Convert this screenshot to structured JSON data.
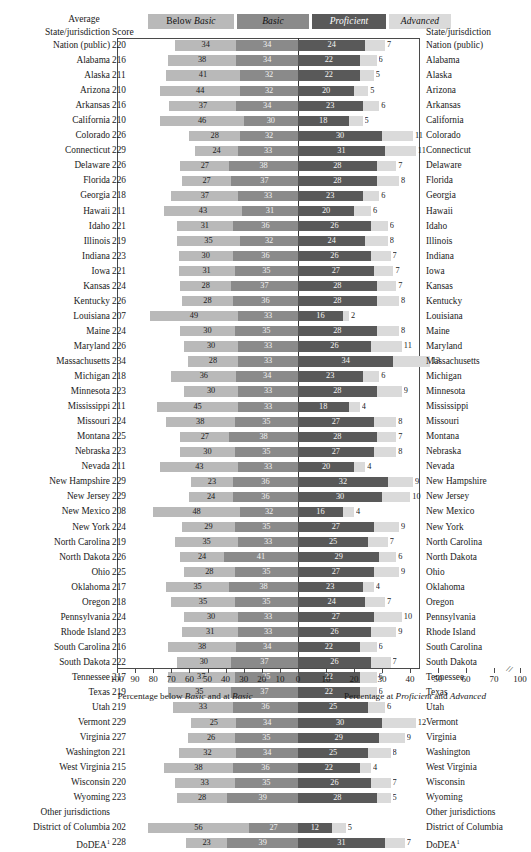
{
  "headers": {
    "average": "Average",
    "score": "Score",
    "state_left": "State/jurisdiction",
    "state_right": "State/jurisdiction"
  },
  "legend": [
    {
      "key": "below_basic",
      "prefix": "Below ",
      "label": "Basic",
      "color": "#b9b9b9"
    },
    {
      "key": "basic",
      "prefix": "",
      "label": "Basic",
      "color": "#8a8a8a"
    },
    {
      "key": "proficient",
      "prefix": "",
      "label": "Proficient",
      "color": "#595959"
    },
    {
      "key": "advanced",
      "prefix": "",
      "label": "Advanced",
      "color": "#dadada"
    }
  ],
  "axis": {
    "left_caption_pre": "Percentage below ",
    "left_caption_it1": "Basic",
    "left_caption_mid": " and at ",
    "left_caption_it2": "Basic",
    "right_caption_pre": "Percentage at ",
    "right_caption_it1": "Proficient",
    "right_caption_mid": " and ",
    "right_caption_it2": "Advanced",
    "ticks_left": [
      100,
      90,
      80,
      70,
      60,
      50,
      40,
      30,
      20,
      10,
      0
    ],
    "ticks_right": [
      10,
      20,
      30,
      40,
      50,
      60,
      70,
      100
    ],
    "break_glyph": "//"
  },
  "group_label": "Other jurisdictions",
  "dodea_footnote": "1",
  "chart_data": {
    "type": "bar",
    "title": "",
    "xlabel": "Percentage below Basic and at Basic | Percentage at Proficient and Advanced",
    "ylabel": "State/jurisdiction",
    "series": [
      {
        "name": "Below Basic",
        "color": "#b9b9b9"
      },
      {
        "name": "Basic",
        "color": "#8a8a8a"
      },
      {
        "name": "Proficient",
        "color": "#595959"
      },
      {
        "name": "Advanced",
        "color": "#dadada"
      }
    ],
    "xlim_left": [
      0,
      100
    ],
    "xlim_right": [
      0,
      100
    ],
    "grid": false,
    "legend_position": "top",
    "columns": [
      "State/jurisdiction",
      "Average Score",
      "Below Basic",
      "Basic",
      "Proficient",
      "Advanced"
    ],
    "rows": [
      {
        "state": "Nation (public)",
        "score": 220,
        "below_basic": 34,
        "basic": 34,
        "proficient": 24,
        "advanced": 7
      },
      {
        "state": "Alabama",
        "score": 216,
        "below_basic": 38,
        "basic": 34,
        "proficient": 22,
        "advanced": 6
      },
      {
        "state": "Alaska",
        "score": 211,
        "below_basic": 41,
        "basic": 32,
        "proficient": 22,
        "advanced": 5
      },
      {
        "state": "Arizona",
        "score": 210,
        "below_basic": 44,
        "basic": 32,
        "proficient": 20,
        "advanced": 5
      },
      {
        "state": "Arkansas",
        "score": 216,
        "below_basic": 37,
        "basic": 34,
        "proficient": 23,
        "advanced": 6
      },
      {
        "state": "California",
        "score": 210,
        "below_basic": 46,
        "basic": 30,
        "proficient": 18,
        "advanced": 5
      },
      {
        "state": "Colorado",
        "score": 226,
        "below_basic": 28,
        "basic": 32,
        "proficient": 30,
        "advanced": 11
      },
      {
        "state": "Connecticut",
        "score": 229,
        "below_basic": 24,
        "basic": 33,
        "proficient": 31,
        "advanced": 11
      },
      {
        "state": "Delaware",
        "score": 226,
        "below_basic": 27,
        "basic": 38,
        "proficient": 28,
        "advanced": 7
      },
      {
        "state": "Florida",
        "score": 226,
        "below_basic": 27,
        "basic": 37,
        "proficient": 28,
        "advanced": 8
      },
      {
        "state": "Georgia",
        "score": 218,
        "below_basic": 37,
        "basic": 33,
        "proficient": 23,
        "advanced": 6
      },
      {
        "state": "Hawaii",
        "score": 211,
        "below_basic": 43,
        "basic": 31,
        "proficient": 20,
        "advanced": 6
      },
      {
        "state": "Idaho",
        "score": 221,
        "below_basic": 31,
        "basic": 36,
        "proficient": 26,
        "advanced": 6
      },
      {
        "state": "Illinois",
        "score": 219,
        "below_basic": 35,
        "basic": 32,
        "proficient": 24,
        "advanced": 8
      },
      {
        "state": "Indiana",
        "score": 223,
        "below_basic": 30,
        "basic": 36,
        "proficient": 26,
        "advanced": 7
      },
      {
        "state": "Iowa",
        "score": 221,
        "below_basic": 31,
        "basic": 35,
        "proficient": 27,
        "advanced": 7
      },
      {
        "state": "Kansas",
        "score": 224,
        "below_basic": 28,
        "basic": 37,
        "proficient": 28,
        "advanced": 7
      },
      {
        "state": "Kentucky",
        "score": 226,
        "below_basic": 28,
        "basic": 36,
        "proficient": 28,
        "advanced": 8
      },
      {
        "state": "Louisiana",
        "score": 207,
        "below_basic": 49,
        "basic": 33,
        "proficient": 16,
        "advanced": 2
      },
      {
        "state": "Maine",
        "score": 224,
        "below_basic": 30,
        "basic": 35,
        "proficient": 28,
        "advanced": 8
      },
      {
        "state": "Maryland",
        "score": 226,
        "below_basic": 30,
        "basic": 33,
        "proficient": 26,
        "advanced": 11
      },
      {
        "state": "Massachusetts",
        "score": 234,
        "below_basic": 28,
        "basic": 33,
        "proficient": 34,
        "advanced": 13
      },
      {
        "state": "Michigan",
        "score": 218,
        "below_basic": 36,
        "basic": 34,
        "proficient": 23,
        "advanced": 6
      },
      {
        "state": "Minnesota",
        "score": 223,
        "below_basic": 30,
        "basic": 33,
        "proficient": 28,
        "advanced": 9
      },
      {
        "state": "Mississippi",
        "score": 211,
        "below_basic": 45,
        "basic": 33,
        "proficient": 18,
        "advanced": 4
      },
      {
        "state": "Missouri",
        "score": 224,
        "below_basic": 38,
        "basic": 35,
        "proficient": 27,
        "advanced": 8
      },
      {
        "state": "Montana",
        "score": 225,
        "below_basic": 27,
        "basic": 38,
        "proficient": 28,
        "advanced": 7
      },
      {
        "state": "Nebraska",
        "score": 223,
        "below_basic": 30,
        "basic": 35,
        "proficient": 27,
        "advanced": 8
      },
      {
        "state": "Nevada",
        "score": 211,
        "below_basic": 43,
        "basic": 33,
        "proficient": 20,
        "advanced": 4
      },
      {
        "state": "New Hampshire",
        "score": 229,
        "below_basic": 23,
        "basic": 36,
        "proficient": 32,
        "advanced": 9
      },
      {
        "state": "New Jersey",
        "score": 229,
        "below_basic": 24,
        "basic": 36,
        "proficient": 30,
        "advanced": 10
      },
      {
        "state": "New Mexico",
        "score": 208,
        "below_basic": 48,
        "basic": 32,
        "proficient": 16,
        "advanced": 4
      },
      {
        "state": "New York",
        "score": 224,
        "below_basic": 29,
        "basic": 35,
        "proficient": 27,
        "advanced": 9
      },
      {
        "state": "North Carolina",
        "score": 219,
        "below_basic": 35,
        "basic": 33,
        "proficient": 25,
        "advanced": 7
      },
      {
        "state": "North Dakota",
        "score": 226,
        "below_basic": 24,
        "basic": 41,
        "proficient": 29,
        "advanced": 6
      },
      {
        "state": "Ohio",
        "score": 225,
        "below_basic": 28,
        "basic": 35,
        "proficient": 27,
        "advanced": 9
      },
      {
        "state": "Oklahoma",
        "score": 217,
        "below_basic": 35,
        "basic": 38,
        "proficient": 23,
        "advanced": 4
      },
      {
        "state": "Oregon",
        "score": 218,
        "below_basic": 35,
        "basic": 35,
        "proficient": 24,
        "advanced": 7
      },
      {
        "state": "Pennsylvania",
        "score": 224,
        "below_basic": 30,
        "basic": 33,
        "proficient": 27,
        "advanced": 10
      },
      {
        "state": "Rhode Island",
        "score": 223,
        "below_basic": 31,
        "basic": 33,
        "proficient": 26,
        "advanced": 9
      },
      {
        "state": "South Carolina",
        "score": 216,
        "below_basic": 38,
        "basic": 34,
        "proficient": 22,
        "advanced": 6
      },
      {
        "state": "South Dakota",
        "score": 222,
        "below_basic": 30,
        "basic": 37,
        "proficient": 26,
        "advanced": 7
      },
      {
        "state": "Tennessee",
        "score": 217,
        "below_basic": 37,
        "basic": 35,
        "proficient": 22,
        "advanced": 6
      },
      {
        "state": "Texas",
        "score": 219,
        "below_basic": 35,
        "basic": 37,
        "proficient": 22,
        "advanced": 6
      },
      {
        "state": "Utah",
        "score": 219,
        "below_basic": 33,
        "basic": 36,
        "proficient": 25,
        "advanced": 6
      },
      {
        "state": "Vermont",
        "score": 229,
        "below_basic": 25,
        "basic": 34,
        "proficient": 30,
        "advanced": 12
      },
      {
        "state": "Virginia",
        "score": 227,
        "below_basic": 26,
        "basic": 35,
        "proficient": 29,
        "advanced": 9
      },
      {
        "state": "Washington",
        "score": 221,
        "below_basic": 32,
        "basic": 34,
        "proficient": 25,
        "advanced": 8
      },
      {
        "state": "West Virginia",
        "score": 215,
        "below_basic": 38,
        "basic": 36,
        "proficient": 22,
        "advanced": 4
      },
      {
        "state": "Wisconsin",
        "score": 220,
        "below_basic": 33,
        "basic": 35,
        "proficient": 26,
        "advanced": 7
      },
      {
        "state": "Wyoming",
        "score": 223,
        "below_basic": 28,
        "basic": 39,
        "proficient": 28,
        "advanced": 5
      },
      {
        "state": "Other jurisdictions",
        "score": "",
        "group": true
      },
      {
        "state": "District of Columbia",
        "score": 202,
        "below_basic": 56,
        "basic": 27,
        "proficient": 12,
        "advanced": 5
      },
      {
        "state": "DoDEA",
        "score": 228,
        "below_basic": 23,
        "basic": 39,
        "proficient": 31,
        "advanced": 7,
        "footnote": "1"
      }
    ]
  }
}
